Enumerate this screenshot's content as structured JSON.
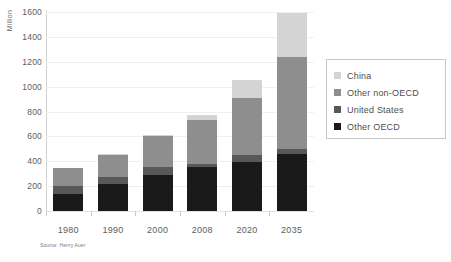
{
  "chart_data": {
    "type": "bar",
    "stacked": true,
    "title": "",
    "subtitle": "",
    "xlabel": "",
    "ylabel": "Million",
    "ylim": [
      0,
      1600
    ],
    "ytick_step": 200,
    "yticks": [
      0,
      200,
      400,
      600,
      800,
      1000,
      1200,
      1400,
      1600
    ],
    "grid": true,
    "legend_position": "right",
    "categories": [
      "1980",
      "1990",
      "2000",
      "2008",
      "2020",
      "2035"
    ],
    "series": [
      {
        "name": "Other OECD",
        "color": "#1a1a1a",
        "values": [
          140,
          215,
          290,
          350,
          395,
          460
        ]
      },
      {
        "name": "United States",
        "color": "#585858",
        "values": [
          60,
          60,
          65,
          30,
          55,
          35
        ]
      },
      {
        "name": "Other non-OECD",
        "color": "#8e8e8e",
        "values": [
          145,
          175,
          245,
          355,
          460,
          740
        ]
      },
      {
        "name": "China",
        "color": "#d4d4d4",
        "values": [
          0,
          5,
          15,
          40,
          140,
          355
        ]
      }
    ],
    "totals": [
      345,
      455,
      615,
      775,
      1050,
      1590
    ],
    "source": "Source: Henry Auer"
  },
  "legend": {
    "entries": [
      {
        "label": "China",
        "color": "#d4d4d4"
      },
      {
        "label": "Other non-OECD",
        "color": "#8e8e8e"
      },
      {
        "label": "United States",
        "color": "#585858"
      },
      {
        "label": "Other OECD",
        "color": "#1a1a1a"
      }
    ]
  },
  "colors": {
    "china": "#d4d4d4",
    "other_non_oecd": "#8e8e8e",
    "united_states": "#585858",
    "other_oecd": "#1a1a1a",
    "axis": "#c9c9c9",
    "grid": "#f0f0f0",
    "text": "#5d5d5d",
    "background": "#ffffff"
  }
}
